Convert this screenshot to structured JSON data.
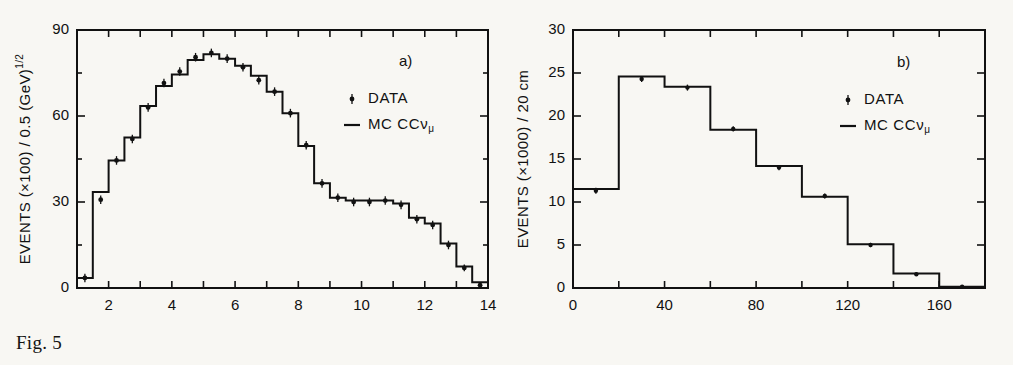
{
  "figure": {
    "caption": "Fig. 5"
  },
  "chart_data": [
    {
      "type": "line",
      "panel_tag": "a)",
      "title": "",
      "xlabel": "√E  (GeV)",
      "xlabel_sup": "1/2",
      "ylabel_prefix": "EVENTS (×100)  /  0.5  (GeV)",
      "ylabel_sup": "1/2",
      "xlim": [
        1,
        14
      ],
      "ylim": [
        0,
        90
      ],
      "xticks": [
        1,
        2,
        3,
        4,
        5,
        6,
        7,
        8,
        9,
        10,
        11,
        12,
        13,
        14
      ],
      "xtick_labels": [
        "",
        "2",
        "",
        "4",
        "",
        "6",
        "",
        "8",
        "",
        "10",
        "",
        "12",
        "",
        "14"
      ],
      "yticks": [
        0,
        30,
        60,
        90
      ],
      "ytick_labels": [
        "0",
        "30",
        "60",
        "90"
      ],
      "grid": false,
      "bin_width": 0.5,
      "bin_edges": [
        1.0,
        1.5,
        2.0,
        2.5,
        3.0,
        3.5,
        4.0,
        4.5,
        5.0,
        5.5,
        6.0,
        6.5,
        7.0,
        7.5,
        8.0,
        8.5,
        9.0,
        9.5,
        10.0,
        10.5,
        11.0,
        11.5,
        12.0,
        12.5,
        13.0,
        13.5,
        14.0
      ],
      "series": [
        {
          "name": "MC CCνμ",
          "render": "step",
          "values": [
            3.5,
            33.5,
            44.5,
            52.5,
            63.5,
            70.5,
            74.5,
            79.5,
            81.5,
            80.0,
            77.5,
            74.0,
            68.5,
            61.0,
            49.5,
            36.5,
            31.5,
            30.5,
            30.5,
            30.5,
            29.5,
            24.5,
            22.5,
            15.5,
            7.5,
            2.0
          ]
        },
        {
          "name": "DATA",
          "render": "points",
          "x": [
            1.25,
            1.75,
            2.25,
            2.75,
            3.25,
            3.75,
            4.25,
            4.75,
            5.25,
            5.75,
            6.25,
            6.75,
            7.25,
            7.75,
            8.25,
            8.75,
            9.25,
            9.75,
            10.25,
            10.75,
            11.25,
            11.75,
            12.25,
            12.75,
            13.25,
            13.75
          ],
          "y": [
            3.5,
            30.8,
            44.5,
            52.0,
            63.0,
            71.5,
            75.5,
            80.5,
            82.0,
            80.0,
            77.0,
            72.5,
            68.5,
            61.0,
            49.8,
            36.5,
            31.5,
            30.0,
            30.0,
            30.5,
            29.0,
            24.0,
            22.0,
            15.0,
            7.0,
            1.0
          ],
          "yerr": [
            1.5,
            1.5,
            1.5,
            1.5,
            1.5,
            1.5,
            1.5,
            1.5,
            1.5,
            1.5,
            1.5,
            1.5,
            1.5,
            1.5,
            1.5,
            1.5,
            1.5,
            1.5,
            1.5,
            1.5,
            1.5,
            1.5,
            1.5,
            1.5,
            1.2,
            1.0
          ]
        }
      ],
      "legend": {
        "position": "upper-right",
        "entries": [
          {
            "marker": "point",
            "label": "DATA"
          },
          {
            "marker": "line",
            "label": "MC CCν",
            "label_sub": "μ"
          }
        ]
      }
    },
    {
      "type": "line",
      "panel_tag": "b)",
      "title": "",
      "xlabel": "r  (cm)",
      "xlabel_sup": "",
      "ylabel_prefix": "EVENTS (×1000)  /  20 cm",
      "ylabel_sup": "",
      "xlim": [
        0,
        180
      ],
      "ylim": [
        0,
        30
      ],
      "xticks": [
        0,
        20,
        40,
        60,
        80,
        100,
        120,
        140,
        160,
        180
      ],
      "xtick_labels": [
        "0",
        "",
        "40",
        "",
        "80",
        "",
        "120",
        "",
        "160",
        ""
      ],
      "yticks": [
        0,
        5,
        10,
        15,
        20,
        25,
        30
      ],
      "ytick_labels": [
        "0",
        "5",
        "10",
        "15",
        "20",
        "25",
        "30"
      ],
      "grid": false,
      "bin_width": 20,
      "bin_edges": [
        0,
        20,
        40,
        60,
        80,
        100,
        120,
        140,
        160,
        180
      ],
      "series": [
        {
          "name": "MC CCνμ",
          "render": "step",
          "values": [
            11.5,
            24.6,
            23.4,
            18.4,
            14.2,
            10.6,
            5.1,
            1.7,
            0.15
          ]
        },
        {
          "name": "DATA",
          "render": "points",
          "x": [
            10,
            30,
            50,
            70,
            90,
            110,
            130,
            150,
            170
          ],
          "y": [
            11.3,
            24.3,
            23.3,
            18.5,
            14.0,
            10.7,
            5.0,
            1.6,
            0.15
          ],
          "yerr": [
            0.35,
            0.35,
            0.35,
            0.3,
            0.3,
            0.3,
            0.25,
            0.2,
            0.1
          ]
        }
      ],
      "legend": {
        "position": "upper-right",
        "entries": [
          {
            "marker": "point",
            "label": "DATA"
          },
          {
            "marker": "line",
            "label": "MC CCν",
            "label_sub": "μ"
          }
        ]
      }
    }
  ],
  "colors": {
    "ink": "#111111",
    "paper": "#f8f7f3"
  }
}
